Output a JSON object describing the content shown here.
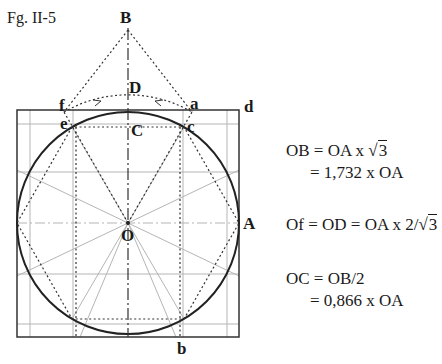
{
  "figure": {
    "title": "Fg. II-5",
    "points": {
      "B": "B",
      "D": "D",
      "f": "f",
      "a": "a",
      "d": "d",
      "e": "e",
      "c": "c",
      "C": "C",
      "O": "O",
      "A": "A",
      "b": "b"
    },
    "geometry": {
      "center": [
        128,
        223
      ],
      "radius": 111,
      "square": {
        "left": 17,
        "top": 110,
        "right": 239,
        "bottom": 337
      }
    }
  },
  "equations": {
    "eq1_line1_lhs": "OB = OA x ",
    "eq1_line1_root": "3",
    "eq1_line2": "= 1,732 x OA",
    "eq2_lhs": "Of = OD = OA x 2/",
    "eq2_root": "3",
    "eq3_line1": "OC = OB/2",
    "eq3_line2": "= 0,866 x OA"
  }
}
